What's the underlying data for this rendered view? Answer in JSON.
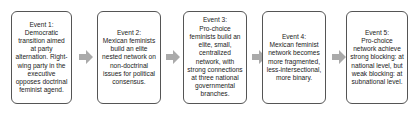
{
  "diagram": {
    "type": "process-flow",
    "direction": "left-to-right",
    "colors": {
      "box_border": "#555555",
      "box_fill": "#ffffff",
      "arrow_fill": "#aaaaaa",
      "text": "#222222"
    },
    "events": [
      {
        "title": "Event 1:",
        "text": "Democratic transition aimed at party alternation. Right-wing party in the executive opposes doctrinal feminist agend."
      },
      {
        "title": "Event 2:",
        "text": "Mexican feminists build an elite nested network on non-doctrinal issues for political consensus."
      },
      {
        "title": "Event 3:",
        "text": "Pro-choice feminists build an elite, small, centralized network, with strong connections at three national governmental branches."
      },
      {
        "title": "Event 4:",
        "text": "Mexican feminist network becomes more fragmented, less-intersectional, more binary."
      },
      {
        "title": "Event 5:",
        "text": "Pro-choice network achieve strong blocking: at national level, but weak blocking: at subnational level."
      }
    ],
    "arrows": [
      {
        "from": 1,
        "to": 2,
        "icon": "right-arrow-icon"
      },
      {
        "from": 2,
        "to": 3,
        "icon": "right-arrow-icon"
      },
      {
        "from": 3,
        "to": 4,
        "icon": "right-arrow-icon"
      },
      {
        "from": 4,
        "to": 5,
        "icon": "right-arrow-icon"
      }
    ]
  }
}
